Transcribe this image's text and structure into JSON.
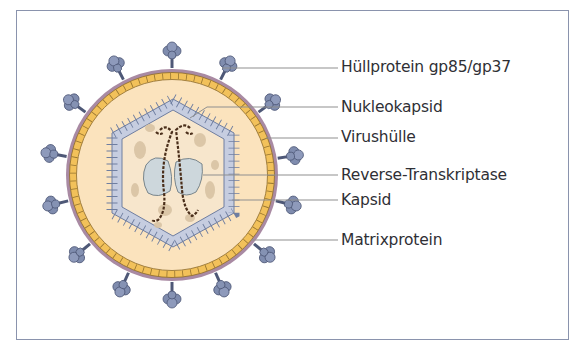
{
  "figure": {
    "type": "virus-structure-diagram",
    "colors": {
      "frame_border": "#8a93ad",
      "envelope": "#a98aa3",
      "matrix_band": "#f2c15a",
      "matrix_cell_border": "#8b6a2a",
      "interior": "#fbe3bd",
      "capsid": "#c6cde0",
      "capsid_border": "#6f7ea0",
      "spike": "#7f8cae",
      "spike_dark": "#4e5877",
      "rna": "#4a2e1a",
      "reverse_transcriptase": "#cdd7dc",
      "speckles": "#d8c3a4",
      "leader_line": "#8f8f8f"
    },
    "labels": [
      {
        "id": "huellprotein",
        "text": "Hüllprotein gp85/gp37",
        "y": 67
      },
      {
        "id": "nukleokapsid",
        "text": "Nukleokapsid",
        "y": 107
      },
      {
        "id": "virushuelle",
        "text": "Virushülle",
        "y": 137
      },
      {
        "id": "reverse-transkriptase",
        "text": "Reverse-Transkriptase",
        "y": 175
      },
      {
        "id": "kapsid",
        "text": "Kapsid",
        "y": 200
      },
      {
        "id": "matrixprotein",
        "text": "Matrixprotein",
        "y": 240
      }
    ]
  }
}
